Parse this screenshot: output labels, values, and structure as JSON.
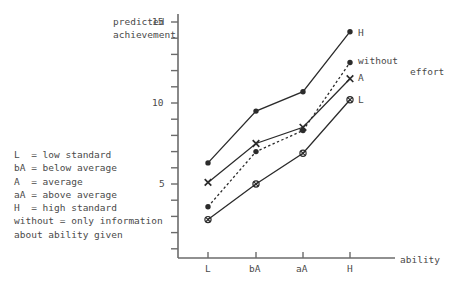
{
  "chart_data": {
    "type": "line",
    "title": "",
    "xlabel": "ability",
    "ylabel": "predicted achievement",
    "ylabel_line1": "predicted",
    "ylabel_line2": "achievement",
    "categories": [
      "L",
      "bA",
      "aA",
      "H"
    ],
    "x_tick_labels": [
      "L",
      "bA",
      "aA",
      "H"
    ],
    "y_tick_labels": [
      "5",
      "10",
      "15"
    ],
    "y_tick_values": [
      5,
      10,
      15
    ],
    "ylim": [
      0,
      16
    ],
    "xlim": [
      0,
      5
    ],
    "grid": false,
    "legend_position": "right-of-endpoints",
    "series": [
      {
        "name": "H",
        "end_label": "H",
        "style": "solid",
        "marker": "filled-circle",
        "values": [
          6.3,
          9.5,
          10.7,
          14.4
        ]
      },
      {
        "name": "without",
        "end_label": "without",
        "style": "dotted",
        "marker": "filled-circle",
        "values": [
          3.6,
          7.0,
          8.3,
          12.5
        ]
      },
      {
        "name": "A",
        "end_label": "A",
        "style": "solid",
        "marker": "cross",
        "values": [
          5.1,
          7.5,
          8.5,
          11.5
        ]
      },
      {
        "name": "L",
        "end_label": "L",
        "style": "solid",
        "marker": "circle-cross",
        "values": [
          2.8,
          5.0,
          6.9,
          10.2
        ]
      }
    ],
    "annotations": [
      {
        "name": "effort-label",
        "text": "effort"
      }
    ]
  },
  "axis": {
    "x_axis_label": "ability",
    "y_label_line1": "predicted",
    "y_label_line2": "achievement",
    "y_ticks": [
      "15",
      "10",
      "5"
    ],
    "x_ticks": [
      "L",
      "bA",
      "aA",
      "H"
    ]
  },
  "endpoint_labels": {
    "h": "H",
    "without": "without",
    "a": "A",
    "l": "L",
    "effort": "effort"
  },
  "legend": {
    "lines": [
      "L  = low standard",
      "bA = below average",
      "A  = average",
      "aA = above average",
      "H  = high standard",
      "without = only information",
      "about ability given"
    ]
  },
  "colors": {
    "ink": "#4a4a4a",
    "axis": "#6b6b6b",
    "line": "#2b2b2b",
    "background": "#ffffff"
  }
}
